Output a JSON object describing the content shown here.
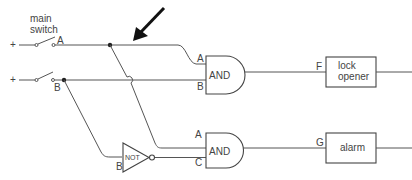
{
  "labels": {
    "main_switch_line1": "main",
    "main_switch_line2": "switch",
    "plus_top": "+",
    "plus_bottom": "+",
    "input_a": "A",
    "input_b": "B",
    "and_top_in_a": "A",
    "and_top_in_b": "B",
    "and_top": "AND",
    "output_f": "F",
    "lock_opener_line1": "lock",
    "lock_opener_line2": "opener",
    "not_gate": "NOT",
    "not_in_b": "B",
    "and_bottom_in_a": "A",
    "and_bottom_in_c": "C",
    "and_bottom": "AND",
    "output_g": "G",
    "alarm": "alarm"
  },
  "colors": {
    "wire": "#555555",
    "text": "#444444",
    "arrow": "#111111"
  }
}
